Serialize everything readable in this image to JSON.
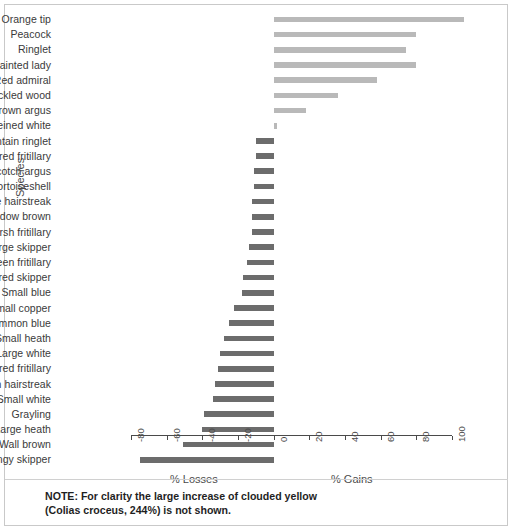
{
  "figure": {
    "title": "",
    "note_lines": [
      "NOTE: For clarity the large increase of clouded yellow",
      "(Colias croceus, 244%) is not shown."
    ]
  },
  "axes": {
    "ylabel": "Species",
    "xlabel_left": "% Losses",
    "xlabel_right": "% Gains",
    "xticks": [
      "-80",
      "-60",
      "-40",
      "-20",
      "0",
      "20",
      "40",
      "60",
      "80",
      "100"
    ],
    "xtick_values": [
      -80,
      -60,
      -40,
      -20,
      0,
      20,
      40,
      60,
      80,
      100
    ]
  },
  "colors": {
    "positive_bar": "#b9b9b9",
    "negative_bar": "#6c6c6c",
    "axis": "#4a4a4a",
    "text": "#3a3a3a",
    "frame": "#c9c9c9",
    "background": "#ffffff"
  },
  "chart_data": {
    "type": "bar",
    "orientation": "horizontal",
    "title": "",
    "subtitle": "",
    "xlabel": "% Losses / % Gains",
    "ylabel": "Species",
    "xlim": [
      -85,
      112
    ],
    "grid": false,
    "legend": "none",
    "annotations": [
      "NOTE: For clarity the large increase of clouded yellow (Colias croceus, 244%) is not shown."
    ],
    "categories": [
      "Orange tip",
      "Peacock",
      "Ringlet",
      "Painted lady",
      "Red admiral",
      "Speckled wood",
      "Northern brown argus",
      "Green-veined white",
      "Mountain ringlet",
      "Small pearl-bordered fritillary",
      "Scotch argus",
      "Small tortoiseshell",
      "Purple hairstreak",
      "Meadow brown",
      "Marsh fritillary",
      "Large skipper",
      "Dark green fritillary",
      "Chequered skipper",
      "Small blue",
      "Small copper",
      "Common blue",
      "Small heath",
      "Large white",
      "Pearl-bordered fritillary",
      "Green hairstreak",
      "Small white",
      "Grayling",
      "Large heath",
      "Wall brown",
      "Dingy skipper"
    ],
    "values": [
      107,
      80,
      74,
      80,
      58,
      36,
      18,
      2,
      -10,
      -10,
      -11,
      -11,
      -12,
      -12,
      -12,
      -14,
      -15,
      -17,
      -18,
      -22,
      -25,
      -28,
      -30,
      -31,
      -33,
      -34,
      -39,
      -40,
      -51,
      -75
    ]
  }
}
